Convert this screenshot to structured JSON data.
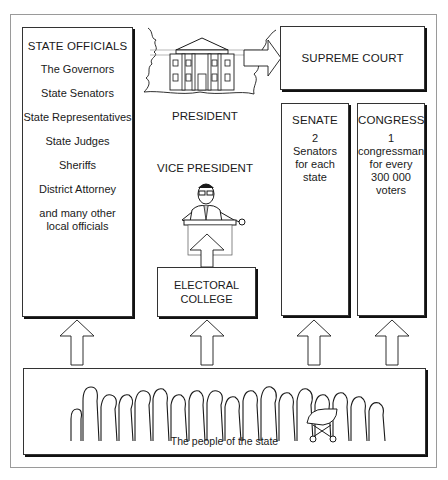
{
  "diagram": {
    "title": "",
    "state_officials": {
      "title": "STATE OFFICIALS",
      "items": [
        "The Governors",
        "State Senators",
        "State Representatives",
        "State Judges",
        "Sheriffs",
        "District Attorney",
        "and many other local officials"
      ]
    },
    "president": {
      "label": "PRESIDENT",
      "icon": "white-house-icon"
    },
    "vice_president": {
      "label": "VICE PRESIDENT",
      "icon": "man-at-podium-icon"
    },
    "supreme_court": {
      "label": "SUPREME COURT"
    },
    "senate": {
      "title": "SENATE",
      "description": "2\nSenators\nfor each\nstate"
    },
    "congress": {
      "title": "CONGRESS",
      "description": "1\ncongressman\nfor every\n300 000\nvoters"
    },
    "electoral_college": {
      "label": "ELECTORAL\nCOLLEGE"
    },
    "people": {
      "label": "The people of the state",
      "icon": "crowd-silhouette-icon"
    },
    "arrows": [
      {
        "from": "people",
        "to": "state_officials"
      },
      {
        "from": "people",
        "to": "electoral_college"
      },
      {
        "from": "people",
        "to": "senate"
      },
      {
        "from": "people",
        "to": "congress"
      },
      {
        "from": "electoral_college",
        "to": "vice_president"
      },
      {
        "from": "president",
        "to": "supreme_court"
      }
    ],
    "colors": {
      "line": "#1a1a1a",
      "frame": "#9a9a9a",
      "background": "#ffffff"
    }
  }
}
